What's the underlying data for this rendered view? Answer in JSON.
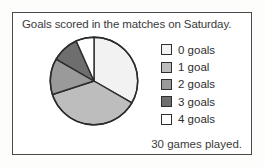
{
  "figure": {
    "title": "Goals scored in the matches on Saturday.",
    "footnote": "30 games played.",
    "frame_color": "#4a4a4a",
    "text_color": "#3a3a3a"
  },
  "legend": {
    "items": [
      {
        "label": "0 goals",
        "color": "#f2f2f2"
      },
      {
        "label": "1 goal",
        "color": "#bdbdbd"
      },
      {
        "label": "2 goals",
        "color": "#9a9a9a"
      },
      {
        "label": "3 goals",
        "color": "#6e6e6e"
      },
      {
        "label": "4 goals",
        "color": "#ffffff"
      }
    ]
  },
  "chart_data": {
    "type": "pie",
    "title": "Goals scored in the matches on Saturday.",
    "annotation": "30 games played.",
    "total_label": "30 games played.",
    "total": 30,
    "unit": "games",
    "start_angle_deg": 0,
    "direction": "clockwise",
    "grid": false,
    "legend_position": "right",
    "categories": [
      "0 goals",
      "1 goal",
      "2 goals",
      "3 goals",
      "4 goals"
    ],
    "values": [
      10,
      11,
      4,
      3,
      2
    ],
    "angles_deg": [
      120,
      132,
      48,
      36,
      24
    ],
    "colors": [
      "#f2f2f2",
      "#bdbdbd",
      "#9a9a9a",
      "#6e6e6e",
      "#ffffff"
    ],
    "stroke": "#2b2b2b",
    "xlabel": "",
    "ylabel": ""
  }
}
